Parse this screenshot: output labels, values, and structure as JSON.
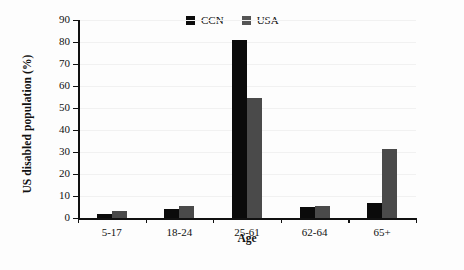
{
  "chart_data": {
    "type": "bar",
    "title": "",
    "xlabel": "Age",
    "ylabel": "US disabled population (%)",
    "categories": [
      "5-17",
      "18-24",
      "25-61",
      "62-64",
      "65+"
    ],
    "series": [
      {
        "name": "CCN",
        "color": "#0b0b0b",
        "values": [
          2,
          4,
          81,
          5,
          7
        ]
      },
      {
        "name": "USA",
        "color": "#4a4a4a",
        "values": [
          3,
          5.5,
          54.5,
          5.5,
          31.5
        ]
      }
    ],
    "ylim": [
      0,
      90
    ],
    "yticks": [
      0,
      10,
      20,
      30,
      40,
      50,
      60,
      70,
      80,
      90
    ],
    "ytick_labels": [
      "0",
      "10",
      "20",
      "30",
      "40",
      "50",
      "60",
      "70",
      "80",
      "90"
    ],
    "grid": "horizontal",
    "legend_position": "top-center"
  },
  "legend": {
    "entries": [
      {
        "label": "CCN"
      },
      {
        "label": "USA"
      }
    ]
  }
}
